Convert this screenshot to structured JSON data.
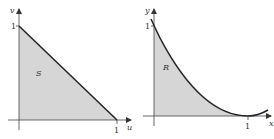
{
  "figures": [
    {
      "name": "triangle-region-S",
      "region_label": "S",
      "x_axis_label": "u",
      "y_axis_label": "v",
      "x_tick": "1",
      "y_tick": "1",
      "boundary": "v = 1 - u",
      "fill_color": "#d6d6d6",
      "line_color": "#222222"
    },
    {
      "name": "curved-region-R",
      "region_label": "R",
      "x_axis_label": "x",
      "y_axis_label": "y",
      "x_tick": "1",
      "y_tick": "1",
      "boundary": "y = (1 - x)^2",
      "fill_color": "#d6d6d6",
      "line_color": "#222222"
    }
  ]
}
